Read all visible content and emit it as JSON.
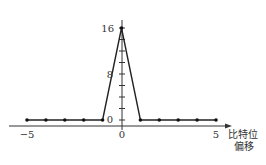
{
  "chart_data": {
    "type": "line",
    "title": "",
    "xlabel": "比特位偏移",
    "xlabel_lines": [
      "比特位",
      "偏移"
    ],
    "ylabel": "",
    "x": [
      -5,
      -4,
      -3,
      -2,
      -1,
      0,
      1,
      2,
      3,
      4,
      5
    ],
    "series": [
      {
        "name": "correlation",
        "values": [
          0,
          0,
          0,
          0,
          0,
          16,
          0,
          0,
          0,
          0,
          0
        ]
      }
    ],
    "x_tick_labels": [
      "-5",
      "0",
      "5"
    ],
    "y_tick_labels": [
      "0",
      "8",
      "16"
    ],
    "y_minor_ticks": [
      0,
      2,
      4,
      6,
      8,
      10,
      12,
      14,
      16
    ],
    "xlim": [
      -5,
      5
    ],
    "ylim": [
      0,
      16
    ],
    "grid": false,
    "legend": null,
    "markers": true
  },
  "labels": {
    "x_neg5": "−5",
    "x_0": "0",
    "x_5": "5",
    "y_0": "0",
    "y_8": "8",
    "y_16": "16",
    "xaxis_line1": "比特位",
    "xaxis_line2": "偏移"
  }
}
